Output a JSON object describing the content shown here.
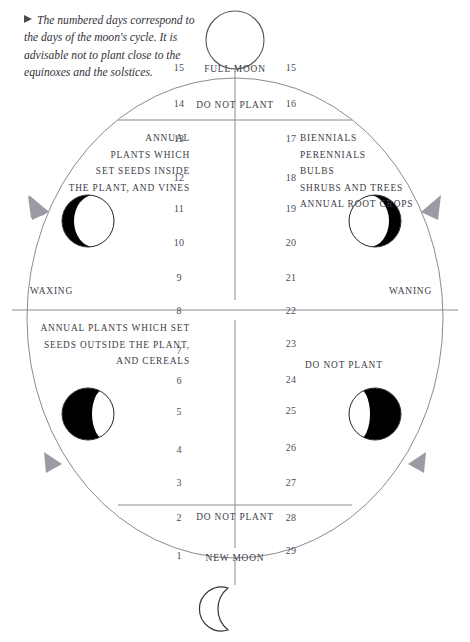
{
  "note": {
    "bullet": "▶",
    "text": "The numbered days correspond to the days of the moon's cycle. It is advisable not to plant close to the equinoxes and the solstices."
  },
  "labels": {
    "full_moon": "FULL MOON",
    "new_moon": "NEW MOON",
    "waxing": "WAXING",
    "waning": "WANING",
    "do_not_plant_top": "DO NOT PLANT",
    "do_not_plant_bottom": "DO NOT PLANT",
    "do_not_plant_right": "DO NOT PLANT"
  },
  "quadrants": {
    "top_left": {
      "lines": [
        "ANNUAL",
        "PLANTS WHICH",
        "SET SEEDS INSIDE",
        "THE PLANT, AND VINES"
      ]
    },
    "top_right": {
      "lines": [
        "BIENNIALS",
        "PERENNIALS",
        "BULBS",
        "SHRUBS AND TREES",
        "ANNUAL ROOT CROPS"
      ]
    },
    "bottom_left": {
      "lines": [
        "ANNUAL PLANTS WHICH SET",
        "SEEDS OUTSIDE THE PLANT,",
        "AND CEREALS"
      ]
    },
    "bottom_right": {
      "lines": []
    }
  },
  "left_days": [
    "15",
    "14",
    "13",
    "12",
    "11",
    "10",
    "9",
    "8",
    "7",
    "6",
    "5",
    "4",
    "3",
    "2",
    "1"
  ],
  "right_days": [
    "15",
    "16",
    "17",
    "18",
    "19",
    "20",
    "21",
    "22",
    "23",
    "24",
    "25",
    "26",
    "27",
    "28",
    "29"
  ],
  "moons": [
    {
      "name": "full-moon",
      "phase": "full"
    },
    {
      "name": "waxing-gibbous-moon",
      "phase": "waxing-gibbous"
    },
    {
      "name": "waning-gibbous-moon",
      "phase": "waning-gibbous"
    },
    {
      "name": "waxing-crescent-moon",
      "phase": "waxing-crescent"
    },
    {
      "name": "waning-crescent-moon",
      "phase": "waning-crescent"
    },
    {
      "name": "new-moon",
      "phase": "new"
    }
  ],
  "colors": {
    "ink": "#3a3a42",
    "line": "#8a8a92",
    "arrow": "#9a9aa2",
    "dark": "#000000",
    "paper": "#ffffff"
  }
}
